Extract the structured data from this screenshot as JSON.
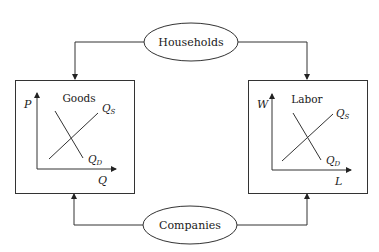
{
  "diagram": {
    "type": "circular-flow",
    "nodes": {
      "households": {
        "label": "Households",
        "shape": "ellipse"
      },
      "companies": {
        "label": "Companies",
        "shape": "ellipse"
      }
    },
    "markets": [
      {
        "id": "goods",
        "title": "Goods",
        "y_axis": "P",
        "x_axis": "Q",
        "supply_label": "Q",
        "supply_sub": "S",
        "demand_label": "Q",
        "demand_sub": "D"
      },
      {
        "id": "labor",
        "title": "Labor",
        "y_axis": "W",
        "x_axis": "L",
        "supply_label": "Q",
        "supply_sub": "S",
        "demand_label": "Q",
        "demand_sub": "D"
      }
    ],
    "edges": [
      {
        "from": "households",
        "to": "goods"
      },
      {
        "from": "households",
        "to": "labor"
      },
      {
        "from": "companies",
        "to": "goods"
      },
      {
        "from": "companies",
        "to": "labor"
      }
    ]
  },
  "colors": {
    "line": "#333333",
    "text": "#1a1a1a",
    "background": "#ffffff"
  }
}
